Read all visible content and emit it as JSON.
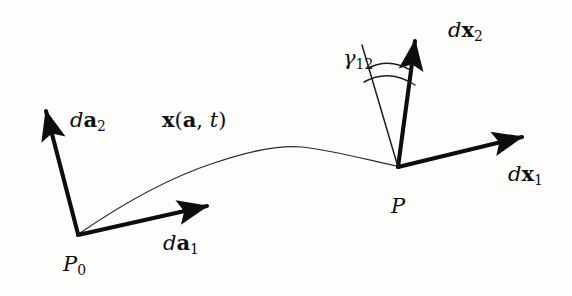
{
  "figure": {
    "kind": "deformation-diagram",
    "background_color": "#fdfdfc",
    "ink_color": "#0d0d0d"
  },
  "labels": {
    "da2": {
      "d": "d",
      "vec": "a",
      "sub": "2"
    },
    "da1": {
      "d": "d",
      "vec": "a",
      "sub": "1"
    },
    "dx2": {
      "d": "d",
      "vec": "x",
      "sub": "2"
    },
    "dx1": {
      "d": "d",
      "vec": "x",
      "sub": "1"
    },
    "motion": {
      "vec": "x",
      "open": "(",
      "arg": "a",
      "comma": ", ",
      "time": "t",
      "close": ")"
    },
    "gamma": {
      "sym": "γ",
      "sub": "12"
    },
    "point_initial": {
      "sym": "P",
      "sub": "0"
    },
    "point_current": {
      "sym": "P"
    }
  },
  "geometry": {
    "P0": {
      "x": 78,
      "y": 235
    },
    "P": {
      "x": 398,
      "y": 167
    },
    "da2_tip": {
      "x": 42,
      "y": 105
    },
    "da1_tip": {
      "x": 212,
      "y": 205
    },
    "dx2_tip": {
      "x": 419,
      "y": 35
    },
    "dx1_tip": {
      "x": 528,
      "y": 135
    },
    "gamma_ref_tip": {
      "x": 362,
      "y": 45
    },
    "curve_peak": {
      "x": 295,
      "y": 148
    },
    "arc_count": 2
  }
}
